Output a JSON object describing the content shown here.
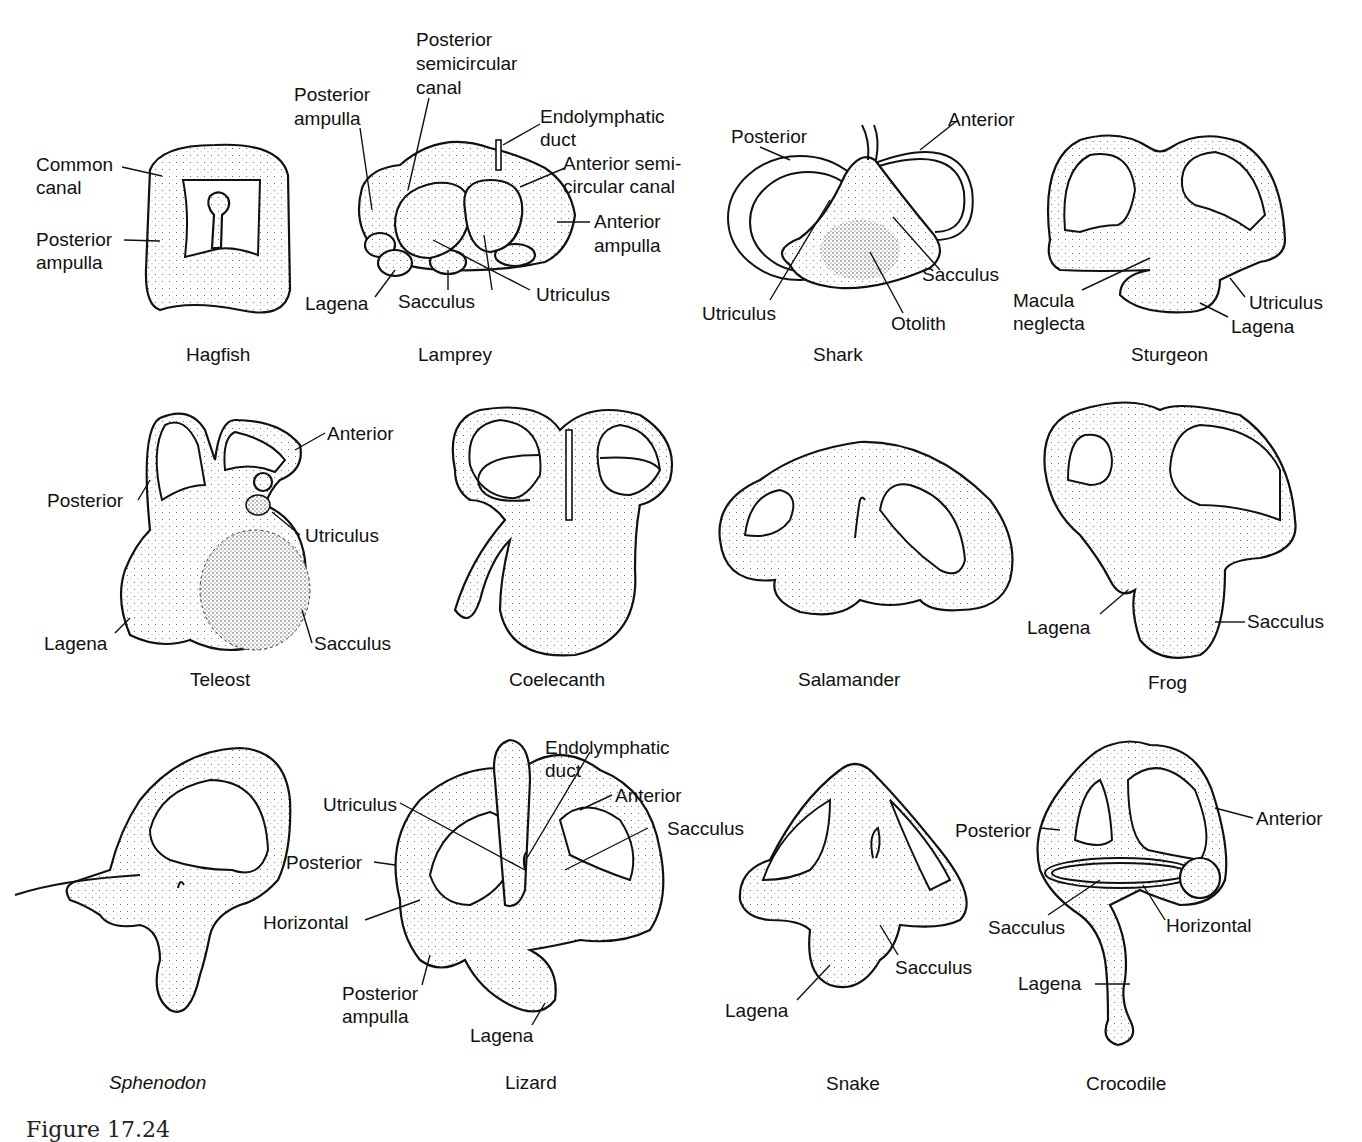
{
  "figure": {
    "title_fragment": "Figure 17.24",
    "panels": [
      {
        "id": "hagfish",
        "caption": "Hagfish",
        "italic": false,
        "labels": [
          "Common canal",
          "Posterior ampulla"
        ]
      },
      {
        "id": "lamprey",
        "caption": "Lamprey",
        "italic": false,
        "labels": [
          "Posterior semicircular canal",
          "Posterior ampulla",
          "Endolymphatic duct",
          "Anterior semi-circular canal",
          "Anterior ampulla",
          "Utriculus",
          "Sacculus",
          "Lagena"
        ]
      },
      {
        "id": "shark",
        "caption": "Shark",
        "italic": false,
        "labels": [
          "Posterior",
          "Anterior",
          "Sacculus",
          "Utriculus",
          "Otolith"
        ]
      },
      {
        "id": "sturgeon",
        "caption": "Sturgeon",
        "italic": false,
        "labels": [
          "Macula neglecta",
          "Utriculus",
          "Lagena"
        ]
      },
      {
        "id": "teleost",
        "caption": "Teleost",
        "italic": false,
        "labels": [
          "Anterior",
          "Posterior",
          "Utriculus",
          "Lagena",
          "Sacculus"
        ]
      },
      {
        "id": "coelecanth",
        "caption": "Coelecanth",
        "italic": false,
        "labels": []
      },
      {
        "id": "salamander",
        "caption": "Salamander",
        "italic": false,
        "labels": []
      },
      {
        "id": "frog",
        "caption": "Frog",
        "italic": false,
        "labels": [
          "Lagena",
          "Sacculus"
        ]
      },
      {
        "id": "sphenodon",
        "caption": "Sphenodon",
        "italic": true,
        "labels": []
      },
      {
        "id": "lizard",
        "caption": "Lizard",
        "italic": false,
        "labels": [
          "Endolymphatic duct",
          "Utriculus",
          "Anterior",
          "Sacculus",
          "Posterior",
          "Horizontal",
          "Posterior ampulla",
          "Lagena"
        ]
      },
      {
        "id": "snake",
        "caption": "Snake",
        "italic": false,
        "labels": [
          "Sacculus",
          "Lagena"
        ]
      },
      {
        "id": "crocodile",
        "caption": "Crocodile",
        "italic": false,
        "labels": [
          "Posterior",
          "Anterior",
          "Sacculus",
          "Horizontal",
          "Lagena"
        ]
      }
    ]
  },
  "text": {
    "hagfish": {
      "caption": "Hagfish",
      "common": "Common",
      "canal": "canal",
      "posterior": "Posterior",
      "ampulla": "ampulla"
    },
    "lamprey": {
      "caption": "Lamprey",
      "psc1": "Posterior",
      "psc2": "semicircular",
      "psc3": "canal",
      "pa1": "Posterior",
      "pa2": "ampulla",
      "ed1": "Endolymphatic",
      "ed2": "duct",
      "asc1": "Anterior semi-",
      "asc2": "circular canal",
      "aa1": "Anterior",
      "aa2": "ampulla",
      "utriculus": "Utriculus",
      "sacculus": "Sacculus",
      "lagena": "Lagena"
    },
    "shark": {
      "caption": "Shark",
      "posterior": "Posterior",
      "anterior": "Anterior",
      "sacculus": "Sacculus",
      "utriculus": "Utriculus",
      "otolith": "Otolith"
    },
    "sturgeon": {
      "caption": "Sturgeon",
      "macula": "Macula",
      "neglecta": "neglecta",
      "utriculus": "Utriculus",
      "lagena": "Lagena"
    },
    "teleost": {
      "caption": "Teleost",
      "anterior": "Anterior",
      "posterior": "Posterior",
      "utriculus": "Utriculus",
      "lagena": "Lagena",
      "sacculus": "Sacculus"
    },
    "coelecanth": {
      "caption": "Coelecanth"
    },
    "salamander": {
      "caption": "Salamander"
    },
    "frog": {
      "caption": "Frog",
      "lagena": "Lagena",
      "sacculus": "Sacculus"
    },
    "sphenodon": {
      "caption": "Sphenodon"
    },
    "lizard": {
      "caption": "Lizard",
      "ed1": "Endolymphatic",
      "ed2": "duct",
      "utriculus": "Utriculus",
      "anterior": "Anterior",
      "sacculus": "Sacculus",
      "posterior": "Posterior",
      "horizontal": "Horizontal",
      "pa1": "Posterior",
      "pa2": "ampulla",
      "lagena": "Lagena"
    },
    "snake": {
      "caption": "Snake",
      "sacculus": "Sacculus",
      "lagena": "Lagena"
    },
    "crocodile": {
      "caption": "Crocodile",
      "posterior": "Posterior",
      "anterior": "Anterior",
      "sacculus": "Sacculus",
      "horizontal": "Horizontal",
      "lagena": "Lagena"
    }
  },
  "colors": {
    "ink": "#111111",
    "background": "#ffffff"
  }
}
